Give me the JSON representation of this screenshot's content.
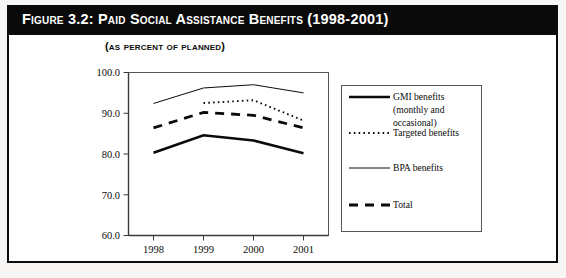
{
  "figure": {
    "title": "Figure 3.2: Paid Social Assistance Benefits (1998-2001)",
    "subtitle": "(as percent of planned)"
  },
  "colors": {
    "title_bar": "#0a0a0a",
    "title_text": "#ffffff",
    "ink": "#0b0b0b",
    "page": "#ffffff",
    "frame": "#0b0b0b"
  },
  "axis": {
    "y_ticks": [
      "100.0",
      "90.0",
      "80.0",
      "70.0",
      "60.0"
    ],
    "x_ticks": [
      "1998",
      "1999",
      "2000",
      "2001"
    ]
  },
  "legend": {
    "items": [
      {
        "label": "GMI benefits (monthly and occasional)",
        "style": "thick-solid"
      },
      {
        "label": "Targeted benefits",
        "style": "dotted"
      },
      {
        "label": "BPA benefits",
        "style": "thin-solid"
      },
      {
        "label": "Total",
        "style": "dashed"
      }
    ],
    "lines": [
      "GMI benefits",
      "(monthly and",
      "occasional)",
      "Targeted benefits",
      "BPA benefits",
      "Total"
    ]
  },
  "chart_data": {
    "type": "line",
    "title": "Figure 3.2: Paid Social Assistance Benefits (1998-2001)",
    "subtitle": "(as percent of planned)",
    "xlabel": "",
    "ylabel": "",
    "x": [
      1998,
      1999,
      2000,
      2001
    ],
    "categories": [
      "1998",
      "1999",
      "2000",
      "2001"
    ],
    "ylim": [
      60.0,
      100.0
    ],
    "ytick_step": 10.0,
    "grid": false,
    "legend_position": "right",
    "series": [
      {
        "name": "GMI benefits (monthly and occasional)",
        "style": "thick-solid",
        "values": [
          80.3,
          84.6,
          83.3,
          80.2
        ]
      },
      {
        "name": "Targeted benefits",
        "style": "dotted",
        "x": [
          1999,
          2000,
          2001
        ],
        "values": [
          92.5,
          93.2,
          88.2
        ]
      },
      {
        "name": "BPA benefits",
        "style": "thin-solid",
        "values": [
          92.4,
          96.2,
          97.0,
          95.0
        ]
      },
      {
        "name": "Total",
        "style": "dashed",
        "values": [
          86.4,
          90.2,
          89.5,
          86.4
        ]
      }
    ]
  }
}
